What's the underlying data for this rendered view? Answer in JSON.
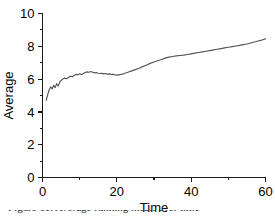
{
  "figure": {
    "background_color": "#ffffff",
    "caption_fragment": "Figure 11. Average running mean over time"
  },
  "chart_data": {
    "type": "line",
    "title": "",
    "subtitle": "",
    "xlabel": "Time",
    "ylabel": "Average",
    "xlim": [
      0,
      60
    ],
    "ylim": [
      0,
      10
    ],
    "grid": false,
    "legend": false,
    "legend_position": "none",
    "line_color": "#555555",
    "axis_color": "#1a1a1a",
    "x_ticks_major": [
      0,
      20,
      40,
      60
    ],
    "x_ticks_major_labels": [
      "0",
      "20",
      "40",
      "60"
    ],
    "x_ticks_minor": [
      10,
      30,
      50
    ],
    "y_ticks_major": [
      0,
      2,
      4,
      6,
      8,
      10
    ],
    "y_ticks_major_labels": [
      "0",
      "2",
      "4",
      "6",
      "8",
      "10"
    ],
    "y_ticks_minor": [
      1,
      3,
      5,
      7,
      9
    ],
    "series": [
      {
        "name": "Average",
        "x": [
          1.0,
          1.4,
          1.8,
          2.2,
          2.6,
          3.0,
          3.4,
          3.8,
          4.2,
          4.6,
          5.0,
          5.5,
          6.0,
          6.5,
          7.0,
          7.5,
          8.0,
          8.5,
          9.0,
          9.5,
          10.0,
          10.5,
          11.0,
          11.5,
          12.0,
          12.5,
          13.0,
          13.5,
          14.0,
          14.5,
          15.0,
          15.5,
          16.0,
          16.5,
          17.0,
          17.5,
          18.0,
          18.5,
          19.0,
          19.5,
          20.0,
          20.5,
          21.0,
          21.5,
          22.0,
          23.0,
          24.0,
          25.0,
          26.0,
          27.0,
          28.0,
          29.0,
          30.0,
          31.0,
          32.0,
          33.0,
          34.0,
          35.0,
          36.0,
          37.0,
          38.0,
          39.0,
          40.0,
          41.0,
          42.0,
          43.0,
          44.0,
          45.0,
          46.0,
          47.0,
          48.0,
          49.0,
          50.0,
          51.0,
          52.0,
          53.0,
          54.0,
          55.0,
          56.0,
          57.0,
          58.0,
          59.0,
          60.0
        ],
        "y": [
          4.7,
          5.05,
          5.35,
          5.52,
          5.4,
          5.62,
          5.48,
          5.72,
          5.58,
          5.8,
          5.92,
          6.0,
          6.06,
          6.02,
          6.1,
          6.18,
          6.14,
          6.22,
          6.3,
          6.26,
          6.32,
          6.28,
          6.34,
          6.4,
          6.44,
          6.42,
          6.46,
          6.42,
          6.38,
          6.4,
          6.36,
          6.34,
          6.36,
          6.32,
          6.34,
          6.3,
          6.32,
          6.28,
          6.3,
          6.26,
          6.24,
          6.26,
          6.28,
          6.3,
          6.34,
          6.42,
          6.5,
          6.58,
          6.66,
          6.76,
          6.86,
          6.96,
          7.04,
          7.12,
          7.2,
          7.28,
          7.34,
          7.38,
          7.42,
          7.44,
          7.46,
          7.5,
          7.54,
          7.58,
          7.62,
          7.66,
          7.7,
          7.74,
          7.78,
          7.82,
          7.86,
          7.9,
          7.94,
          7.98,
          8.02,
          8.06,
          8.1,
          8.14,
          8.2,
          8.26,
          8.32,
          8.38,
          8.45
        ]
      }
    ],
    "annotations": []
  }
}
